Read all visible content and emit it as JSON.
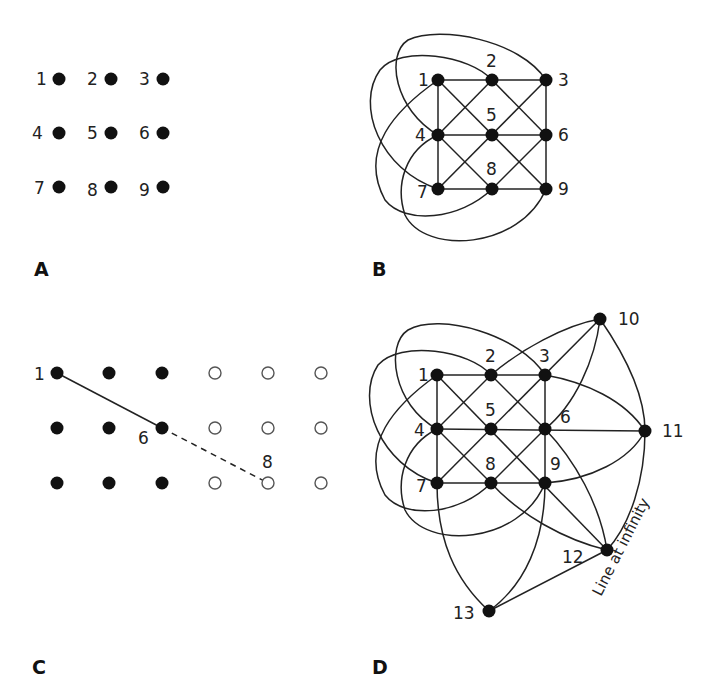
{
  "figure": {
    "panels": [
      {
        "id": "A",
        "label": "A",
        "description": "Nine points arranged in a 3x3 grid",
        "points": [
          {
            "n": "1",
            "x": 59,
            "y": 79
          },
          {
            "n": "2",
            "x": 111,
            "y": 79
          },
          {
            "n": "3",
            "x": 163,
            "y": 79
          },
          {
            "n": "4",
            "x": 59,
            "y": 133
          },
          {
            "n": "5",
            "x": 111,
            "y": 133
          },
          {
            "n": "6",
            "x": 163,
            "y": 133
          },
          {
            "n": "7",
            "x": 59,
            "y": 187
          },
          {
            "n": "8",
            "x": 111,
            "y": 187
          },
          {
            "n": "9",
            "x": 163,
            "y": 187
          }
        ]
      },
      {
        "id": "B",
        "label": "B",
        "description": "Affine plane of order 3: 12 lines through 9 points",
        "points": [
          {
            "n": "1",
            "x": 438,
            "y": 80
          },
          {
            "n": "2",
            "x": 492,
            "y": 80
          },
          {
            "n": "3",
            "x": 546,
            "y": 80
          },
          {
            "n": "4",
            "x": 438,
            "y": 135
          },
          {
            "n": "5",
            "x": 492,
            "y": 135
          },
          {
            "n": "6",
            "x": 546,
            "y": 135
          },
          {
            "n": "7",
            "x": 438,
            "y": 189
          },
          {
            "n": "8",
            "x": 492,
            "y": 189
          },
          {
            "n": "9",
            "x": 546,
            "y": 189
          }
        ],
        "curved_lines": [
          [
            "3",
            "4",
            "8"
          ],
          [
            "2",
            "7",
            "6"
          ],
          [
            "1",
            "6",
            "8"
          ],
          [
            "2",
            "4",
            "9"
          ]
        ]
      },
      {
        "id": "C",
        "label": "C",
        "description": "Extended grid showing line through 1 and 6 continuing to 8",
        "filled_grid": {
          "cols": 3,
          "rows": 3
        },
        "hollow_grid": {
          "cols": 3,
          "rows": 3
        },
        "point_labels": [
          "1",
          "6",
          "8"
        ]
      },
      {
        "id": "D",
        "label": "D",
        "description": "Projective plane of order 3 with 13 points and line at infinity",
        "points": [
          {
            "n": "1",
            "x": 437,
            "y": 375
          },
          {
            "n": "2",
            "x": 491,
            "y": 375
          },
          {
            "n": "3",
            "x": 545,
            "y": 375
          },
          {
            "n": "4",
            "x": 437,
            "y": 429
          },
          {
            "n": "5",
            "x": 491,
            "y": 429
          },
          {
            "n": "6",
            "x": 545,
            "y": 429
          },
          {
            "n": "7",
            "x": 437,
            "y": 483
          },
          {
            "n": "8",
            "x": 491,
            "y": 483
          },
          {
            "n": "9",
            "x": 545,
            "y": 483
          },
          {
            "n": "10",
            "x": 600,
            "y": 319
          },
          {
            "n": "11",
            "x": 645,
            "y": 431
          },
          {
            "n": "12",
            "x": 607,
            "y": 550
          },
          {
            "n": "13",
            "x": 489,
            "y": 611
          }
        ],
        "annotation": "Line at infinity"
      }
    ]
  },
  "labels": {
    "A": {
      "p1": "1",
      "p2": "2",
      "p3": "3",
      "p4": "4",
      "p5": "5",
      "p6": "6",
      "p7": "7",
      "p8": "8",
      "p9": "9"
    },
    "B": {
      "p1": "1",
      "p2": "2",
      "p3": "3",
      "p4": "4",
      "p5": "5",
      "p6": "6",
      "p7": "7",
      "p8": "8",
      "p9": "9"
    },
    "C": {
      "p1": "1",
      "p6": "6",
      "p8": "8"
    },
    "D": {
      "p1": "1",
      "p2": "2",
      "p3": "3",
      "p4": "4",
      "p5": "5",
      "p6": "6",
      "p7": "7",
      "p8": "8",
      "p9": "9",
      "p10": "10",
      "p11": "11",
      "p12": "12",
      "p13": "13",
      "infinity": "Line at infinity"
    },
    "panel_A": "A",
    "panel_B": "B",
    "panel_C": "C",
    "panel_D": "D"
  }
}
